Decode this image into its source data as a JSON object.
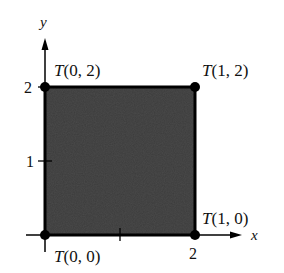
{
  "axes": {
    "x_label": "x",
    "y_label": "y",
    "x_ticks": [
      "1",
      "2"
    ],
    "y_ticks": [
      "1",
      "2"
    ],
    "x_tick_label_2": "2",
    "y_tick_label_1": "1",
    "y_tick_label_2": "2"
  },
  "region": {
    "fill_color": "#3c3c3c",
    "border_color": "#000000"
  },
  "points": [
    {
      "label": "T(0, 2)",
      "func": "T",
      "args": "(0, 2)"
    },
    {
      "label": "T(1, 2)",
      "func": "T",
      "args": "(1, 2)"
    },
    {
      "label": "T(1, 0)",
      "func": "T",
      "args": "(1, 0)"
    },
    {
      "label": "T(0, 0)",
      "func": "T",
      "args": "(0, 0)"
    }
  ]
}
